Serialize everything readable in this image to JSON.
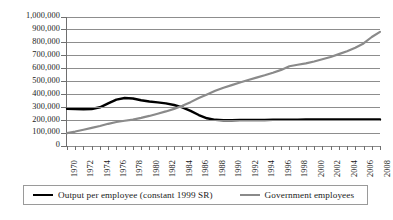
{
  "chart_data": {
    "type": "line",
    "title": "",
    "xlabel": "",
    "ylabel": "",
    "grid": true,
    "legend_position": "bottom",
    "ylim": [
      0,
      1000000
    ],
    "ytick_labels": [
      "1,000,000",
      "900,000",
      "800,000",
      "700,000",
      "600,000",
      "500,000",
      "400,000",
      "300,000",
      "200,000",
      "100,000",
      "0"
    ],
    "ytick_values": [
      1000000,
      900000,
      800000,
      700000,
      600000,
      500000,
      400000,
      300000,
      200000,
      100000,
      0
    ],
    "xlim": [
      1970,
      2008
    ],
    "xtick_labels": [
      "1970",
      "1972",
      "1974",
      "1976",
      "1978",
      "1980",
      "1982",
      "1984",
      "1986",
      "1988",
      "1990",
      "1992",
      "1994",
      "1996",
      "1998",
      "2000",
      "2002",
      "2004",
      "2006",
      "2008"
    ],
    "x": [
      1970,
      1971,
      1972,
      1973,
      1974,
      1975,
      1976,
      1977,
      1978,
      1979,
      1980,
      1981,
      1982,
      1983,
      1984,
      1985,
      1986,
      1987,
      1988,
      1989,
      1990,
      1991,
      1992,
      1993,
      1994,
      1995,
      1996,
      1997,
      1998,
      1999,
      2000,
      2001,
      2002,
      2003,
      2004,
      2005,
      2006,
      2007,
      2008
    ],
    "series": [
      {
        "name": "Output per employee (constant 1999 SR)",
        "color": "#000000",
        "values": [
          288000,
          286000,
          285000,
          287000,
          300000,
          330000,
          360000,
          372000,
          368000,
          355000,
          345000,
          338000,
          330000,
          318000,
          300000,
          272000,
          240000,
          215000,
          203000,
          200000,
          200000,
          201000,
          201000,
          202000,
          202000,
          203000,
          203000,
          204000,
          204000,
          205000,
          205000,
          205000,
          205000,
          206000,
          206000,
          206000,
          206000,
          206000,
          205000
        ]
      },
      {
        "name": "Government employees",
        "color": "#8a8a8a",
        "values": [
          100000,
          112000,
          126000,
          140000,
          155000,
          172000,
          186000,
          196000,
          205000,
          218000,
          233000,
          250000,
          268000,
          288000,
          312000,
          340000,
          372000,
          400000,
          428000,
          452000,
          472000,
          492000,
          512000,
          530000,
          548000,
          568000,
          590000,
          618000,
          630000,
          640000,
          655000,
          672000,
          690000,
          712000,
          735000,
          762000,
          795000,
          845000,
          885000
        ]
      }
    ]
  },
  "legend": {
    "items": [
      {
        "label": "Output per employee (constant 1999 SR)",
        "marker": "black-line-swatch"
      },
      {
        "label": "Government employees",
        "marker": "gray-line-swatch"
      }
    ]
  }
}
